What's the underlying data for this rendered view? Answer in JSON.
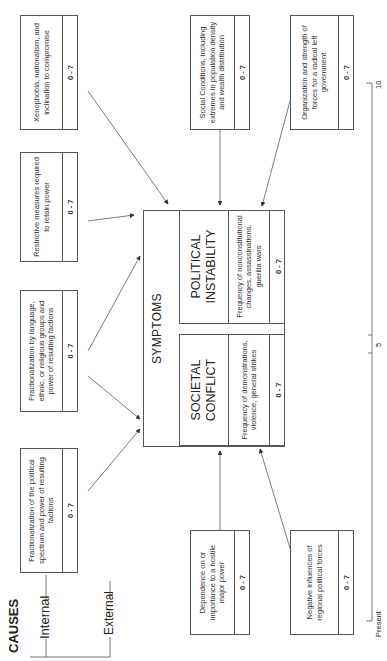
{
  "causes": {
    "title": "CAUSES",
    "internal_label": "Internal",
    "external_label": "External"
  },
  "cause_boxes": [
    {
      "id": "political-spectrum",
      "text": "Fractionalization of the political spectrum and power of resulting factions",
      "score": "0 - 7"
    },
    {
      "id": "language-groups",
      "text": "Fractionalization by language, ethnic, or religious groups and power of resulting factions",
      "score": "0 - 7"
    },
    {
      "id": "restrictive-measures",
      "text": "Restrictive measures required to retain power",
      "score": "0 - 7"
    },
    {
      "id": "xenophobia",
      "text": "Xenophobia, nationalism, and inclination to compromise",
      "score": "0 - 7"
    },
    {
      "id": "hostile-power",
      "text": "Dependence on or importance to a hostile major power",
      "score": "0 - 7"
    },
    {
      "id": "social-conditions",
      "text": "Social Conditions, including extremes in population density and wealth distribution",
      "score": "0 - 7"
    },
    {
      "id": "regional-forces",
      "text": "Negative influences of regional political forces",
      "score": "0 - 7"
    },
    {
      "id": "radical-left",
      "text": "Organization and strength of forces for a radical left government",
      "score": "0 - 7"
    }
  ],
  "symptoms": {
    "title": "SYMPTOMS",
    "societal_conflict": {
      "heading_line1": "SOCIETAL",
      "heading_line2": "CONFLICT",
      "description": "Frequency of demonstrations, violence, general strikes",
      "score": "0 - 7"
    },
    "political_instability": {
      "heading_line1": "POLITICAL",
      "heading_line2": "INSTABILITY",
      "description": "Frequency of nonconstitutional changes, assassinations, guerilla wars",
      "score": "0 - 7"
    }
  },
  "timeline": {
    "start_label": "Present",
    "mid_label": "5",
    "end_label": "10"
  }
}
